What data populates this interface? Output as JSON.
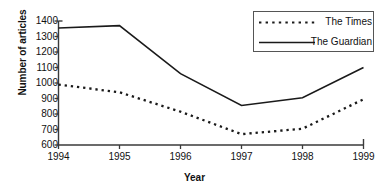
{
  "chart_data": {
    "type": "line",
    "title": "",
    "xlabel": "Year",
    "ylabel": "Number of articles",
    "categories": [
      "1994",
      "1995",
      "1996",
      "1997",
      "1998",
      "1999"
    ],
    "x": [
      1994,
      1995,
      1996,
      1997,
      1998,
      1999
    ],
    "xlim": [
      1994,
      1999
    ],
    "ylim": [
      600,
      1400
    ],
    "yticks": [
      600,
      700,
      800,
      900,
      1000,
      1100,
      1200,
      1300,
      1400
    ],
    "ytick_labels": [
      "600",
      "700",
      "800",
      "900",
      "1000",
      "1100",
      "1200",
      "1300",
      "1400"
    ],
    "grid": false,
    "legend_position": "top-right",
    "series": [
      {
        "name": "The Times",
        "style": "dotted",
        "color": "#1a1a1a",
        "values": [
          990,
          940,
          815,
          670,
          705,
          895
        ]
      },
      {
        "name": "The Guardian",
        "style": "solid",
        "color": "#1a1a1a",
        "values": [
          1355,
          1370,
          1060,
          855,
          905,
          1100
        ]
      }
    ]
  },
  "axes": {
    "y_title": "Number of articles",
    "x_title": "Year"
  },
  "legend": {
    "entries": [
      {
        "label": "The Times",
        "style": "dotted"
      },
      {
        "label": "The Guardian",
        "style": "solid"
      }
    ]
  }
}
